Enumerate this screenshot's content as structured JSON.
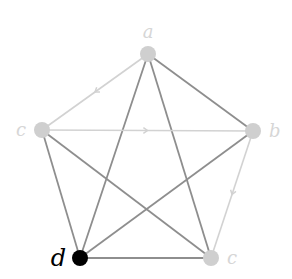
{
  "diagram": {
    "type": "graph",
    "colors": {
      "background": "#ffffff",
      "dark_edge": "#8e8e8e",
      "light_edge": "#d2d2d2",
      "light_node": "#cfcfcf",
      "highlight_node": "#000000",
      "light_label": "#d6d6d6",
      "highlight_label": "#000000"
    },
    "nodes": [
      {
        "id": "a",
        "label": "a",
        "x": 148,
        "y": 54,
        "highlighted": false
      },
      {
        "id": "b",
        "label": "b",
        "x": 253,
        "y": 131,
        "highlighted": false
      },
      {
        "id": "c1",
        "label": "c",
        "x": 42,
        "y": 130,
        "highlighted": false
      },
      {
        "id": "c2",
        "label": "c",
        "x": 211,
        "y": 258,
        "highlighted": false
      },
      {
        "id": "d",
        "label": "d",
        "x": 80,
        "y": 258,
        "highlighted": true
      }
    ],
    "edges": [
      {
        "from": "a",
        "to": "c1",
        "style": "light",
        "directed": true
      },
      {
        "from": "c1",
        "to": "b",
        "style": "light",
        "directed": true
      },
      {
        "from": "b",
        "to": "c2",
        "style": "light",
        "directed": true
      },
      {
        "from": "a",
        "to": "b",
        "style": "dark",
        "directed": false
      },
      {
        "from": "a",
        "to": "d",
        "style": "dark",
        "directed": false
      },
      {
        "from": "a",
        "to": "c2",
        "style": "dark",
        "directed": false
      },
      {
        "from": "c1",
        "to": "d",
        "style": "dark",
        "directed": false
      },
      {
        "from": "c1",
        "to": "c2",
        "style": "dark",
        "directed": false
      },
      {
        "from": "b",
        "to": "d",
        "style": "dark",
        "directed": false
      },
      {
        "from": "d",
        "to": "c2",
        "style": "dark",
        "directed": false
      }
    ]
  }
}
